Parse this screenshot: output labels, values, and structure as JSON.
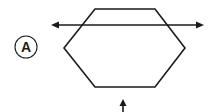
{
  "diagram": {
    "label": "A",
    "colors": {
      "stroke": "#1a1a1a",
      "background": "#ffffff"
    },
    "hexagon": {
      "points": "95,9 155,9 185,48 155,87 95,87 64,48"
    },
    "horizontal_arrow": {
      "x1": 52,
      "x2": 203,
      "y": 25,
      "double_headed": true
    },
    "vertical_arrow": {
      "x": 123,
      "y_tip": 100,
      "y_end": 112
    },
    "label_circle": {
      "cx": 26,
      "cy": 47,
      "r": 11
    }
  }
}
